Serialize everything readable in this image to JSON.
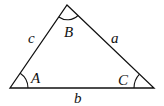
{
  "diagram": {
    "type": "triangle",
    "vertices": {
      "A": {
        "label": "A",
        "x": 10,
        "y": 88
      },
      "B": {
        "label": "B",
        "x": 67,
        "y": 5
      },
      "C": {
        "label": "C",
        "x": 154,
        "y": 88
      }
    },
    "sides": {
      "a": {
        "label": "a"
      },
      "b": {
        "label": "b"
      },
      "c": {
        "label": "c"
      }
    },
    "stroke_color": "#111111"
  }
}
